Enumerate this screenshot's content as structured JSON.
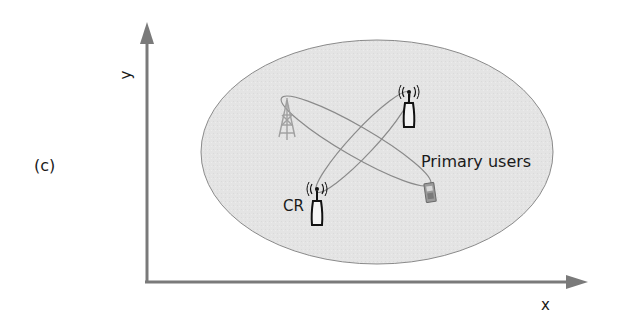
{
  "figure": {
    "panel_label": "(c)",
    "axes": {
      "x_label": "x",
      "y_label": "y"
    },
    "labels": {
      "cognitive_radio": "CR",
      "primary_users": "Primary users"
    },
    "elements": [
      {
        "type": "coverage-ellipse",
        "fill": "#e6e6e6"
      },
      {
        "type": "cell-tower",
        "color": "#9a9a9a"
      },
      {
        "type": "antenna",
        "role": "primary-user-transmitter"
      },
      {
        "type": "antenna",
        "role": "cognitive-radio"
      },
      {
        "type": "mobile-phone",
        "role": "primary-user-receiver"
      },
      {
        "type": "beam-lobe",
        "from": "cell-tower",
        "to": "mobile-phone"
      },
      {
        "type": "beam-lobe",
        "from": "cognitive-radio",
        "to": "antenna"
      }
    ],
    "colors": {
      "axis": "#7a7a7a",
      "ellipse_fill": "#e6e6e6",
      "ellipse_stroke": "#888888",
      "icon": "#111111"
    }
  }
}
